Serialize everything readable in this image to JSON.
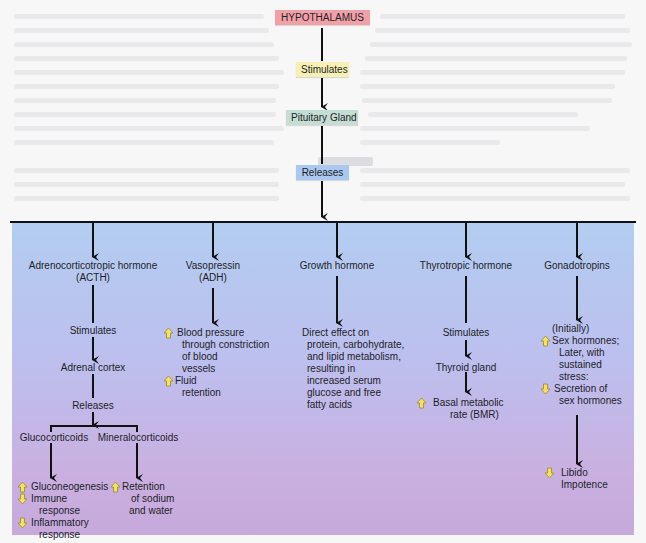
{
  "flow": {
    "hypothalamus": "HYPOTHALAMUS",
    "stimulates": "Stimulates",
    "pituitary": "Pituitary Gland",
    "releases": "Releases"
  },
  "colors": {
    "hypothalamus_bg": "#f2a0a8",
    "stimulates_bg": "#f6f0b4",
    "pituitary_bg": "#c5ddd3",
    "releases_bg": "#a9c9f0",
    "panel_top": "#b3cdf1",
    "panel_bottom": "#c7a9dc",
    "increase_icon": "#f3df6a",
    "decrease_icon": "#f3df6a"
  },
  "columns": {
    "acth": {
      "title_1": "Adrenocorticotropic hormone",
      "title_2": "(ACTH)",
      "step1": "Stimulates",
      "step2": "Adrenal cortex",
      "step3": "Releases",
      "gluco": "Glucocorticoids",
      "mineralo": "Mineralocorticoids",
      "gluco_effects": [
        {
          "dir": "increase",
          "lines": [
            "Gluconeogenesis"
          ]
        },
        {
          "dir": "decrease",
          "lines": [
            "Immune",
            "response"
          ]
        },
        {
          "dir": "decrease",
          "lines": [
            "Inflammatory",
            "response"
          ]
        }
      ],
      "mineralo_effects": [
        {
          "dir": "increase",
          "lines": [
            "Retention",
            "of sodium",
            "and water"
          ]
        }
      ]
    },
    "adh": {
      "title_1": "Vasopressin",
      "title_2": "(ADH)",
      "effects": [
        {
          "dir": "increase",
          "lines": [
            "Blood pressure",
            "through constriction",
            "of blood",
            "vessels"
          ]
        },
        {
          "dir": "increase",
          "lines": [
            "Fluid",
            "retention"
          ]
        }
      ]
    },
    "gh": {
      "title": "Growth hormone",
      "effect_lines": [
        "Direct effect on",
        "protein, carbohydrate,",
        "and lipid metabolism,",
        "resulting in",
        "increased serum",
        "glucose and free",
        "fatty acids"
      ]
    },
    "thyro": {
      "title": "Thyrotropic hormone",
      "step1": "Stimulates",
      "step2": "Thyroid gland",
      "effects": [
        {
          "dir": "increase",
          "lines": [
            "Basal metabolic",
            "rate (BMR)"
          ]
        }
      ]
    },
    "gonado": {
      "title": "Gonadotropins",
      "initially": "(Initially)",
      "effects": [
        {
          "dir": "increase",
          "lines": [
            "Sex hormones;",
            "Later, with",
            "sustained",
            "stress:"
          ]
        },
        {
          "dir": "decrease",
          "lines": [
            "Secretion of",
            "sex hormones"
          ]
        }
      ],
      "final": [
        {
          "dir": "decrease",
          "lines": [
            "Libido",
            "Impotence"
          ]
        }
      ]
    }
  }
}
